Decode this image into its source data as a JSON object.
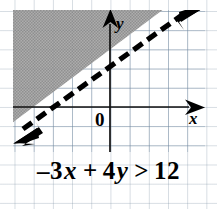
{
  "figure": {
    "name": "linear-inequality-graph",
    "caption": {
      "full_text": "-3x + 4y > 12",
      "lead_sign": "–",
      "coef_x": "3",
      "var_x": "x",
      "operator_plus": "+",
      "coef_y": "4",
      "var_y": "y",
      "relation": ">",
      "constant": "12"
    },
    "axes": {
      "x_label": "x",
      "y_label": "y",
      "origin_label": "0",
      "x_axis_direction": "right",
      "y_axis_direction": "up"
    },
    "icons": {
      "x_axis_arrow": "arrow-right-icon",
      "y_axis_arrow": "arrow-up-icon",
      "boundary_arrow_upper": "arrow-up-right-icon",
      "boundary_arrow_lower": "arrow-down-left-icon"
    },
    "colors": {
      "ink": "#000000",
      "grid": "#6e87a0",
      "shade": "#9a9a9a",
      "paper": "#ffffff"
    }
  },
  "chart_data": {
    "type": "line",
    "xlabel": "x",
    "ylabel": "y",
    "boundary": {
      "equation": "-3x + 4y = 12",
      "slope_form": "y = 0.75x + 3",
      "slope": 0.75,
      "y_intercept": 3,
      "x_intercept": -4,
      "style": "dashed",
      "included": false,
      "arrows_both_ends": true
    },
    "inequality": {
      "relation": ">",
      "shaded_side": "above-left",
      "shading_style": "halftone-gray",
      "test_point": "(0, 0)",
      "test_result": "false"
    },
    "xlim": [
      -5.7,
      4.3
    ],
    "ylim": [
      -2.3,
      5.1
    ],
    "grid": true,
    "grid_step": 1,
    "legend": "none"
  }
}
